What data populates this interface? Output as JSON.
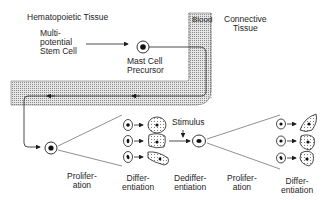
{
  "regions": {
    "hematopoietic": "Hematopoietic Tissue",
    "blood": "Blood",
    "connective": "Connective\nTissue"
  },
  "cells": {
    "stem_cell": "Multi-\npotential\nStem Cell",
    "precursor": "Mast Cell\nPrecursor"
  },
  "stimulus": "Stimulus",
  "stages": [
    {
      "label": "Prolifer-\nation"
    },
    {
      "label": "Differ-\nentiation"
    },
    {
      "label": "Dediffer-\nentiation"
    },
    {
      "label": "Prolifer-\nation"
    },
    {
      "label": "Differ-\nentiation"
    }
  ],
  "colors": {
    "ink": "#1e1e1e",
    "vessel_fill": "#bdbdbd"
  }
}
